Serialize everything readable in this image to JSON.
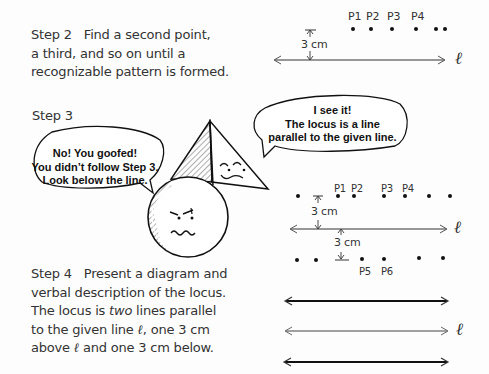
{
  "step2": {
    "label": "Step 2",
    "lines": [
      "Find a second point,",
      "a third, and so on until a",
      "recognizable pattern is formed."
    ]
  },
  "step3": {
    "label": "Step 3",
    "bubble_left": [
      "No! You goofed!",
      "You didn’t follow Step 3.",
      "Look below the line."
    ],
    "bubble_right": [
      "I see it!",
      "The locus is a line",
      "parallel to the given line."
    ]
  },
  "step4": {
    "label": "Step 4",
    "line1": "Present a diagram and",
    "line2": "verbal description of the locus.",
    "line3_pre": "The locus is ",
    "line3_em": "two",
    "line3_post": " lines parallel",
    "line4_pre": "to the given line ",
    "line4_post": ", one 3 cm",
    "line5_mid": " and one 3 cm below.",
    "line5_pre": "above "
  },
  "diagram": {
    "line_symbol": "ℓ",
    "distance_label": "3 cm",
    "top_points": [
      "P1",
      "P2",
      "P3",
      "P4"
    ],
    "lower_points": [
      "P5",
      "P6"
    ]
  }
}
